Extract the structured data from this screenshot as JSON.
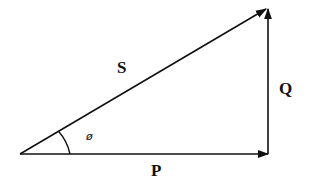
{
  "diagram": {
    "labels": {
      "hypotenuse": "S",
      "vertical": "Q",
      "horizontal": "P",
      "angle": "ø"
    },
    "colors": {
      "line": "#111111",
      "background": "#ffffff"
    }
  }
}
